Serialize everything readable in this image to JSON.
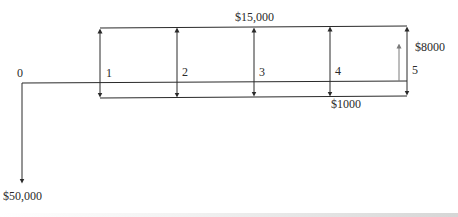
{
  "diagram": {
    "type": "cash-flow-diagram",
    "time_labels": [
      "0",
      "1",
      "2",
      "3",
      "4",
      "5"
    ],
    "initial_outflow": {
      "period": "0",
      "label": "$50,000",
      "direction": "down"
    },
    "revenue_band": {
      "label": "$15,000",
      "periods": [
        "1",
        "2",
        "3",
        "4",
        "5"
      ],
      "direction": "up"
    },
    "cost_band": {
      "label": "$1000",
      "periods": [
        "1",
        "2",
        "3",
        "4",
        "5"
      ],
      "direction": "down"
    },
    "salvage": {
      "period": "5",
      "label": "$8000",
      "direction": "up"
    },
    "colors": {
      "line": "#2a2a2a",
      "salvage_arrow": "#7a7a7a",
      "background": "#ffffff"
    }
  }
}
